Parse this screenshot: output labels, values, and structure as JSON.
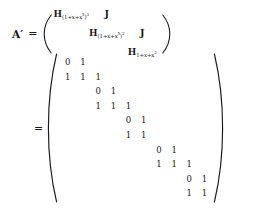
{
  "document": {
    "type": "mathematical-equation",
    "background_color": "#ffffff",
    "text_color": "#1a1a1a"
  },
  "equation_top": {
    "lhs": "A",
    "lhs_prime": "′",
    "equals": "=",
    "left_paren": "(",
    "right_paren": ")",
    "matrix": {
      "rows": 3,
      "cols": 3,
      "cells": [
        [
          {
            "kind": "H",
            "base": "H",
            "sub": "(1+x+x",
            "sub_sup": "5",
            "sub_tail": ")",
            "sub_exp": "3",
            "text": "H(1+x+x⁵)³"
          },
          {
            "kind": "J",
            "text": "J"
          },
          {
            "kind": "blank",
            "text": ""
          }
        ],
        [
          {
            "kind": "blank",
            "text": ""
          },
          {
            "kind": "H",
            "base": "H",
            "sub": "(1+x+x",
            "sub_sup": "5",
            "sub_tail": ")",
            "sub_exp": "2",
            "text": "H(1+x+x⁵)²"
          },
          {
            "kind": "J",
            "text": "J"
          }
        ],
        [
          {
            "kind": "blank",
            "text": ""
          },
          {
            "kind": "blank",
            "text": ""
          },
          {
            "kind": "H",
            "base": "H",
            "sub": "1+x+x",
            "sub_sup": "2",
            "sub_tail": "",
            "sub_exp": "",
            "text": "H1+x+x²"
          }
        ]
      ]
    }
  },
  "equation_bottom": {
    "equals": "=",
    "left_paren": "(",
    "right_paren": ")",
    "matrix": {
      "rows": 10,
      "cols": 10,
      "description": "block-banded 0/1 matrix",
      "values": [
        [
          "0",
          "1",
          "",
          "",
          "",
          "",
          "",
          "",
          "",
          ""
        ],
        [
          "1",
          "1",
          "1",
          "",
          "",
          "",
          "",
          "",
          "",
          ""
        ],
        [
          "",
          "",
          "0",
          "1",
          "",
          "",
          "",
          "",
          "",
          ""
        ],
        [
          "",
          "",
          "1",
          "1",
          "1",
          "",
          "",
          "",
          "",
          ""
        ],
        [
          "",
          "",
          "",
          "",
          "0",
          "1",
          "",
          "",
          "",
          ""
        ],
        [
          "",
          "",
          "",
          "",
          "1",
          "1",
          "",
          "",
          "",
          ""
        ],
        [
          "",
          "",
          "",
          "",
          "",
          "",
          "0",
          "1",
          "",
          ""
        ],
        [
          "",
          "",
          "",
          "",
          "",
          "",
          "1",
          "1",
          "1",
          ""
        ],
        [
          "",
          "",
          "",
          "",
          "",
          "",
          "",
          "",
          "0",
          "1"
        ],
        [
          "",
          "",
          "",
          "",
          "",
          "",
          "",
          "",
          "1",
          "1"
        ]
      ]
    }
  }
}
